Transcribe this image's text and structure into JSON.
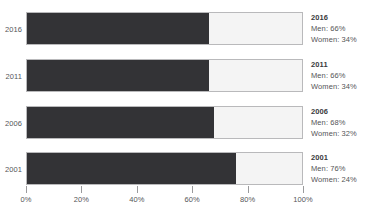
{
  "chart_data": {
    "type": "bar",
    "orientation": "horizontal",
    "stacked": true,
    "title": "",
    "subtitle": "",
    "xlabel": "",
    "ylabel": "",
    "xlim": [
      0,
      100
    ],
    "xtick_labels": [
      "0%",
      "20%",
      "40%",
      "60%",
      "80%",
      "100%"
    ],
    "xtick_values": [
      0,
      20,
      40,
      60,
      80,
      100
    ],
    "grid": false,
    "legend_position": "right",
    "categories": [
      "2016",
      "2011",
      "2006",
      "2001"
    ],
    "series": [
      {
        "name": "Men",
        "values": [
          66,
          66,
          68,
          76
        ],
        "color": "#333336"
      },
      {
        "name": "Women",
        "values": [
          34,
          34,
          32,
          24
        ],
        "color": "#f4f4f4"
      }
    ],
    "annotations": [
      {
        "year": "2016",
        "men": "Men: 66%",
        "women": "Women: 34%"
      },
      {
        "year": "2011",
        "men": "Men: 66%",
        "women": "Women: 34%"
      },
      {
        "year": "2006",
        "men": "Men: 68%",
        "women": "Women: 32%"
      },
      {
        "year": "2001",
        "men": "Men: 76%",
        "women": "Women: 24%"
      }
    ]
  },
  "axis": {
    "y_labels": [
      "2016",
      "2011",
      "2006",
      "2001"
    ],
    "x_labels": [
      "0%",
      "20%",
      "40%",
      "60%",
      "80%",
      "100%"
    ]
  },
  "legend": [
    {
      "year": "2016",
      "men": "Men: 66%",
      "women": "Women: 34%"
    },
    {
      "year": "2011",
      "men": "Men: 66%",
      "women": "Women: 34%"
    },
    {
      "year": "2006",
      "men": "Men: 68%",
      "women": "Women: 32%"
    },
    {
      "year": "2001",
      "men": "Men: 76%",
      "women": "Women: 24%"
    }
  ],
  "colors": {
    "men": "#333336",
    "women": "#f4f4f4",
    "border": "#b9b9bb",
    "text": "#555558",
    "tick": "#9a9a9c"
  }
}
